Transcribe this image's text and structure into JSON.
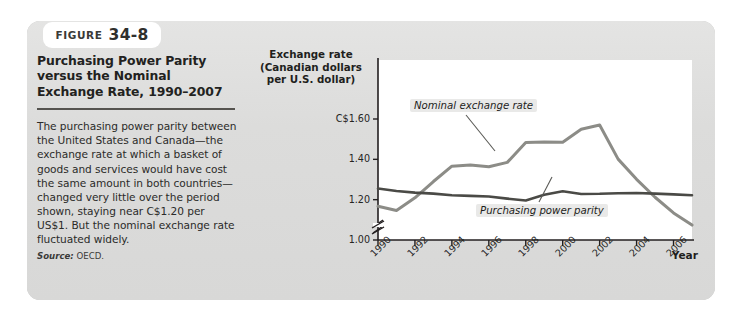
{
  "figure": {
    "badge_word": "Figure",
    "badge_number": "34-8",
    "title": "Purchasing Power Parity versus the Nominal Exchange Rate, 1990–2007",
    "body": "The purchasing power parity between the United States and Canada—the exchange rate at which a basket of goods and services would have cost the same amount in both countries—changed very little over the period shown, staying near C$1.20 per US$1. But the nominal exchange rate fluctuated widely.",
    "source_label": "Source:",
    "source_value": "OECD."
  },
  "colors": {
    "panel_background": "#dededd",
    "badge_background": "#ffffff",
    "plot_background": "#ffffff",
    "nominal_line": "#8c8c87",
    "ppp_line": "#4a4a46",
    "axis": "#231f20",
    "callout_background": "#e9e9e8",
    "rule": "#55534f"
  },
  "chart_data": {
    "type": "line",
    "title": "Purchasing Power Parity versus the Nominal Exchange Rate, 1990–2007",
    "xlabel": "Year",
    "ylabel": "Exchange rate (Canadian dollars per U.S. dollar)",
    "ylabel_lines": [
      "Exchange rate",
      "(Canadian dollars",
      "per U.S. dollar)"
    ],
    "x": [
      1990,
      1991,
      1992,
      1993,
      1994,
      1995,
      1996,
      1997,
      1998,
      1999,
      2000,
      2001,
      2002,
      2003,
      2004,
      2005,
      2006,
      2007
    ],
    "xtick_labels": [
      "1990",
      "1992",
      "1994",
      "1996",
      "1998",
      "2000",
      "2002",
      "2004",
      "2006"
    ],
    "xticks": [
      1990,
      1992,
      1994,
      1996,
      1998,
      2000,
      2002,
      2004,
      2006
    ],
    "ytick_labels": [
      "C$1.60",
      "1.40",
      "1.20",
      "1.00"
    ],
    "yticks": [
      1.6,
      1.4,
      1.2,
      1.0
    ],
    "ylim": [
      0.95,
      1.7
    ],
    "xlim": [
      1990,
      2007
    ],
    "grid": false,
    "axis_break": true,
    "legend": "inline-callouts",
    "series": [
      {
        "name": "Nominal exchange rate",
        "color": "#8c8c87",
        "callout_label": "Nominal exchange rate",
        "values": [
          1.167,
          1.146,
          1.209,
          1.29,
          1.366,
          1.372,
          1.363,
          1.385,
          1.483,
          1.486,
          1.485,
          1.549,
          1.57,
          1.401,
          1.301,
          1.212,
          1.134,
          1.074
        ]
      },
      {
        "name": "Purchasing power parity",
        "color": "#4a4a46",
        "callout_label": "Purchasing power parity",
        "values": [
          1.255,
          1.243,
          1.235,
          1.23,
          1.222,
          1.219,
          1.216,
          1.205,
          1.196,
          1.224,
          1.242,
          1.228,
          1.229,
          1.232,
          1.233,
          1.23,
          1.226,
          1.222
        ]
      }
    ]
  }
}
